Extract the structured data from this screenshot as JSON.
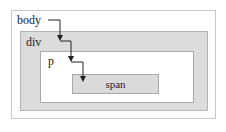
{
  "diagram": {
    "type": "nested-boxes-event-propagation",
    "nodes": [
      {
        "id": "body",
        "label": "body"
      },
      {
        "id": "div",
        "label": "div"
      },
      {
        "id": "p",
        "label": "p"
      },
      {
        "id": "span",
        "label": "span"
      }
    ],
    "edges": [
      {
        "from": "body",
        "to": "div"
      },
      {
        "from": "div",
        "to": "p"
      },
      {
        "from": "p",
        "to": "span"
      }
    ],
    "colors": {
      "outer_fill": "#ffffff",
      "div_fill": "#dcdcdc",
      "p_fill": "#ffffff",
      "span_fill": "#dadada",
      "arrow": "#222222"
    }
  }
}
